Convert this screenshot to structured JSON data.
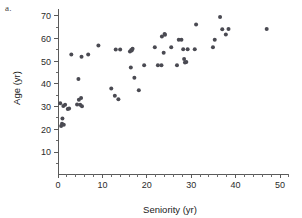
{
  "panel": {
    "label": "a."
  },
  "chart_data": {
    "type": "scatter",
    "title": "",
    "xlabel": "Seniority (yr)",
    "ylabel": "Age (yr)",
    "xlim": [
      0,
      52
    ],
    "ylim": [
      5,
      73
    ],
    "grid": false,
    "legend": null,
    "xticks": [
      0,
      10,
      20,
      30,
      40,
      50
    ],
    "xtick_labels": [
      "0",
      "10",
      "20",
      "30",
      "40",
      "50"
    ],
    "xminor_step": 2,
    "yticks": [
      10,
      20,
      30,
      40,
      50,
      60,
      70
    ],
    "ytick_labels": [
      "10",
      "20",
      "30",
      "40",
      "50",
      "60",
      "70"
    ],
    "yminor_step": 5,
    "marker": "circle",
    "marker_color": "#4a4a52",
    "marker_size": 2.0,
    "points": [
      {
        "x": 0.5,
        "y": 31.5
      },
      {
        "x": 0.7,
        "y": 21.5
      },
      {
        "x": 0.9,
        "y": 22.5
      },
      {
        "x": 1.0,
        "y": 24.8
      },
      {
        "x": 1.2,
        "y": 30.3
      },
      {
        "x": 1.3,
        "y": 22.0
      },
      {
        "x": 1.6,
        "y": 30.8
      },
      {
        "x": 2.2,
        "y": 29.0
      },
      {
        "x": 2.5,
        "y": 29.2
      },
      {
        "x": 3.0,
        "y": 53.0
      },
      {
        "x": 4.3,
        "y": 31.0
      },
      {
        "x": 4.6,
        "y": 42.2
      },
      {
        "x": 4.7,
        "y": 33.0
      },
      {
        "x": 5.0,
        "y": 30.8
      },
      {
        "x": 5.2,
        "y": 33.8
      },
      {
        "x": 5.3,
        "y": 52.0
      },
      {
        "x": 5.4,
        "y": 30.2
      },
      {
        "x": 6.8,
        "y": 53.0
      },
      {
        "x": 9.1,
        "y": 57.0
      },
      {
        "x": 12.0,
        "y": 38.0
      },
      {
        "x": 12.8,
        "y": 34.8
      },
      {
        "x": 13.0,
        "y": 55.2
      },
      {
        "x": 13.6,
        "y": 33.3
      },
      {
        "x": 14.0,
        "y": 55.2
      },
      {
        "x": 16.2,
        "y": 54.3
      },
      {
        "x": 16.4,
        "y": 47.3
      },
      {
        "x": 16.5,
        "y": 55.0
      },
      {
        "x": 16.6,
        "y": 54.8
      },
      {
        "x": 16.8,
        "y": 55.5
      },
      {
        "x": 17.2,
        "y": 42.7
      },
      {
        "x": 18.2,
        "y": 37.2
      },
      {
        "x": 19.4,
        "y": 48.3
      },
      {
        "x": 21.8,
        "y": 56.2
      },
      {
        "x": 22.5,
        "y": 48.3
      },
      {
        "x": 23.3,
        "y": 48.3
      },
      {
        "x": 23.4,
        "y": 61.0
      },
      {
        "x": 23.8,
        "y": 53.8
      },
      {
        "x": 24.0,
        "y": 62.0
      },
      {
        "x": 24.1,
        "y": 61.7
      },
      {
        "x": 25.5,
        "y": 56.2
      },
      {
        "x": 26.8,
        "y": 48.3
      },
      {
        "x": 27.2,
        "y": 59.5
      },
      {
        "x": 27.8,
        "y": 59.5
      },
      {
        "x": 28.2,
        "y": 55.3
      },
      {
        "x": 28.4,
        "y": 51.0
      },
      {
        "x": 28.6,
        "y": 49.5
      },
      {
        "x": 28.9,
        "y": 49.7
      },
      {
        "x": 29.2,
        "y": 55.3
      },
      {
        "x": 30.8,
        "y": 55.3
      },
      {
        "x": 31.1,
        "y": 66.2
      },
      {
        "x": 34.9,
        "y": 56.2
      },
      {
        "x": 35.3,
        "y": 59.5
      },
      {
        "x": 36.5,
        "y": 69.5
      },
      {
        "x": 37.0,
        "y": 64.2
      },
      {
        "x": 37.8,
        "y": 61.8
      },
      {
        "x": 38.4,
        "y": 64.3
      },
      {
        "x": 47.0,
        "y": 64.3
      }
    ]
  }
}
